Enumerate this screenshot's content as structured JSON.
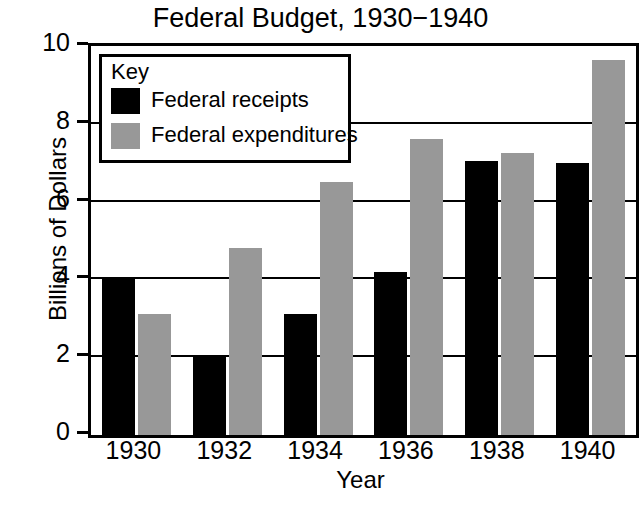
{
  "chart_data": {
    "type": "bar",
    "title": "Federal Budget, 1930−1940",
    "xlabel": "Year",
    "ylabel": "Billions of Dollars",
    "categories": [
      "1930",
      "1932",
      "1934",
      "1936",
      "1938",
      "1940"
    ],
    "series": [
      {
        "name": "Federal receipts",
        "color": "#000000",
        "values": [
          4.0,
          2.0,
          3.1,
          4.2,
          7.05,
          7.0
        ]
      },
      {
        "name": "Federal expenditures",
        "color": "#989898",
        "values": [
          3.1,
          4.8,
          6.5,
          7.6,
          7.25,
          9.65
        ]
      }
    ],
    "ylim": [
      0,
      10
    ],
    "yticks": [
      0,
      2,
      4,
      6,
      8,
      10
    ],
    "ytick_labels": [
      "0",
      "2",
      "4",
      "6",
      "8",
      "10"
    ],
    "grid": true,
    "grid_axis": "y",
    "legend_position": "top-left"
  },
  "legend": {
    "title": "Key",
    "entries": [
      {
        "label": "Federal receipts",
        "swatch": "receipts"
      },
      {
        "label": "Federal expenditures",
        "swatch": "expenditures"
      }
    ]
  }
}
